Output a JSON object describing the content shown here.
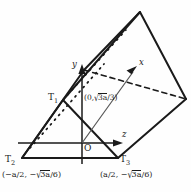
{
  "figure": {
    "background_color": "#fefefe",
    "stroke_color": "#1a1a1a",
    "thin_stroke_color": "#555555"
  },
  "axes": [
    {
      "name": "y-axis",
      "label": "y",
      "direction": "up"
    },
    {
      "name": "z-axis",
      "label": "z",
      "direction": "right"
    },
    {
      "name": "x-axis",
      "label": "x",
      "direction": "back-right",
      "style": "dashed"
    }
  ],
  "origin": {
    "label": "O"
  },
  "vertices": [
    {
      "name": "T1",
      "label": "T",
      "subscript": "1"
    },
    {
      "name": "T2",
      "label": "T",
      "subscript": "2"
    },
    {
      "name": "T3",
      "label": "T",
      "subscript": "3"
    }
  ],
  "coordinates": {
    "apex_prefix": "(0,",
    "apex_numer": "3a",
    "apex_denom": "/3)",
    "left_prefix": "(−a/2, −",
    "left_numer": "3a",
    "left_denom": "/6)",
    "right_prefix": "(a/2, −",
    "right_numer": "3a",
    "right_denom": "/6)",
    "radical_glyph": "√"
  },
  "geometry": {
    "near_triangle": "T1 T2 T3",
    "far_triangle": "translated along x-axis",
    "hidden_edges": "dotted",
    "visible_edges": "solid"
  }
}
